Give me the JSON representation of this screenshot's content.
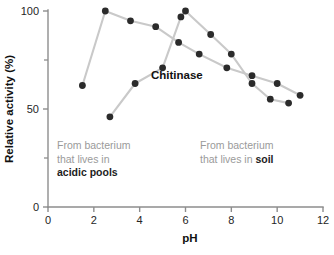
{
  "chart_data": {
    "type": "line",
    "title": "",
    "subtitle": "",
    "xlabel": "pH",
    "ylabel": "Relative activity (%)",
    "xlim": [
      0,
      12
    ],
    "ylim": [
      0,
      100
    ],
    "grid": false,
    "legend_position": "inline-annotations",
    "x_ticks": [
      0,
      2,
      4,
      6,
      8,
      10,
      12
    ],
    "x_tick_labels": [
      "0",
      "2",
      "4",
      "6",
      "8",
      "10",
      "12"
    ],
    "y_ticks": [
      0,
      50,
      100
    ],
    "y_tick_labels": [
      "0",
      "50",
      "100"
    ],
    "y_minor_ticks": [
      25,
      75
    ],
    "enzyme_label": "Chitinase",
    "series": [
      {
        "name": "From bacterium that lives in acidic pools",
        "x": [
          1.5,
          2.5,
          3.6,
          4.7,
          5.7,
          6.6,
          7.8,
          8.9,
          10.0,
          11.0
        ],
        "values": [
          62,
          100,
          95,
          92,
          84,
          78,
          71,
          67,
          63,
          57
        ]
      },
      {
        "name": "From bacterium that lives in soil",
        "x": [
          2.7,
          3.8,
          5.0,
          5.8,
          6.0,
          7.1,
          8.0,
          8.9,
          9.7,
          10.5
        ],
        "values": [
          46,
          63,
          71,
          97,
          100,
          88,
          78,
          63,
          55,
          53
        ]
      }
    ],
    "annotations": [
      {
        "id": "acidic",
        "line1": "From bacterium",
        "line2": "that lives in",
        "emphasis": "acidic pools"
      },
      {
        "id": "soil",
        "line1": "From bacterium",
        "line2_prefix": "that lives in ",
        "emphasis": "soil"
      }
    ],
    "colors": {
      "marker": "#2b2b2b",
      "line": "#c9c9c9",
      "axis": "#8d8d8d",
      "annotation_text": "#9a9a9a",
      "emphasis_text": "#1d1d1d"
    }
  }
}
